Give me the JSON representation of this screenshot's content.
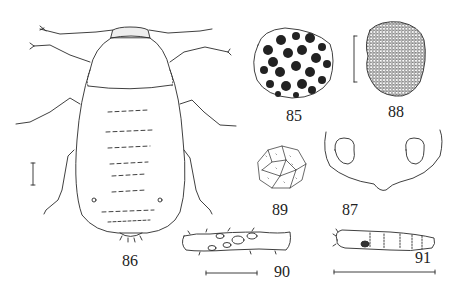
{
  "plate": {
    "figures": [
      {
        "number": "86",
        "subject": "whole larva, dorsal view"
      },
      {
        "number": "85",
        "subject": "cell-like sculptured structure, dark cells"
      },
      {
        "number": "88",
        "subject": "finely reticulate round structure"
      },
      {
        "number": "89",
        "subject": "polygonal reticulate surface detail"
      },
      {
        "number": "87",
        "subject": "head capsule outline with two eye spots"
      },
      {
        "number": "90",
        "subject": "leg segment with oval pits"
      },
      {
        "number": "91",
        "subject": "segmented elongate body, lateral view"
      }
    ],
    "labels": {
      "fig85": "85",
      "fig86": "86",
      "fig87": "87",
      "fig88": "88",
      "fig89": "89",
      "fig90": "90",
      "fig91": "91"
    },
    "scale_bars": [
      "fig86",
      "fig88",
      "fig90",
      "fig91"
    ],
    "colors": {
      "ink": "#2a2a2a",
      "background": "#ffffff",
      "fill_dark": "#222222"
    }
  }
}
